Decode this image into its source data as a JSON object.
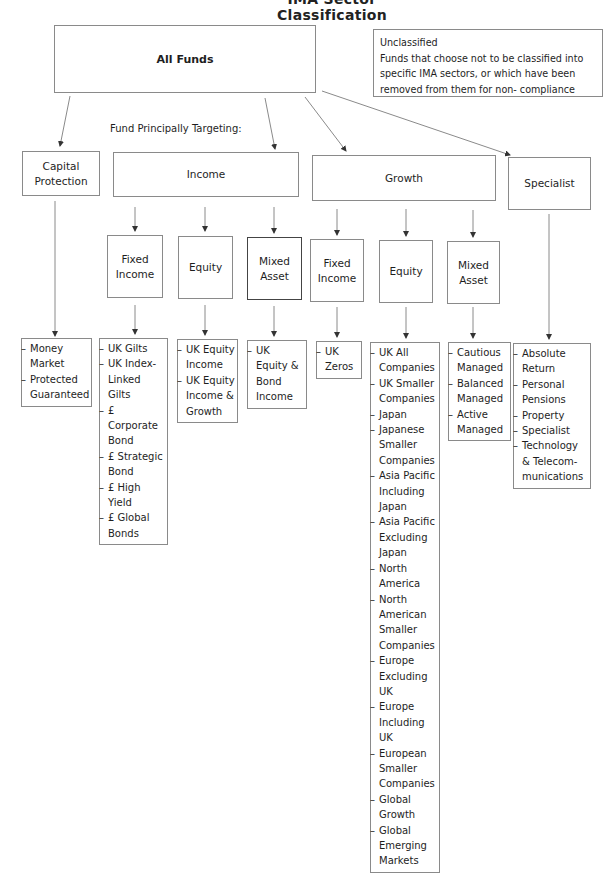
{
  "title": "IMA Sector Classification",
  "root": {
    "label": "All Funds"
  },
  "unclassified": {
    "heading": "Unclassified",
    "description": "Funds that choose not to be classified into specific IMA sectors, or which have been removed from them for non- compliance"
  },
  "targeting_label": "Fund Principally Targeting:",
  "categories": [
    {
      "label": "Capital Protection",
      "sectors": [
        "Money Market",
        "Protected Guaranteed"
      ]
    },
    {
      "label": "Income",
      "groups": [
        {
          "label": "Fixed Income",
          "sectors": [
            "UK Gilts",
            "UK Index-Linked Gilts",
            "£ Corporate Bond",
            "£ Strategic Bond",
            "£ High Yield",
            "£ Global Bonds"
          ]
        },
        {
          "label": "Equity",
          "sectors": [
            "UK Equity Income",
            "UK Equity Income & Growth"
          ]
        },
        {
          "label": "Mixed Asset",
          "sectors": [
            "UK Equity & Bond Income"
          ]
        }
      ]
    },
    {
      "label": "Growth",
      "groups": [
        {
          "label": "Fixed Income",
          "sectors": [
            "UK Zeros"
          ]
        },
        {
          "label": "Equity",
          "sectors": [
            "UK All Companies",
            "UK Smaller Companies",
            "Japan",
            "Japanese Smaller Companies",
            "Asia Pacific Including Japan",
            "Asia Pacific Excluding Japan",
            "North America",
            "North American Smaller Companies",
            "Europe Excluding UK",
            "Europe Including UK",
            "European Smaller Companies",
            "Global Growth",
            "Global Emerging Markets"
          ]
        },
        {
          "label": "Mixed Asset",
          "sectors": [
            "Cautious Managed",
            "Balanced Managed",
            "Active Managed"
          ]
        }
      ]
    },
    {
      "label": "Specialist",
      "sectors": [
        "Absolute Return",
        "Personal Pensions",
        "Property",
        "Specialist",
        "Technology & Telecom-munications"
      ]
    }
  ],
  "colors": {
    "line": "#8a8a8a",
    "text": "#1e1e1e",
    "background": "#ffffff"
  }
}
